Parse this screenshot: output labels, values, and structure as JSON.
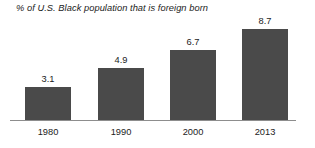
{
  "chart_data": {
    "type": "bar",
    "title": "% of U.S. Black population that is foreign born",
    "xlabel": "",
    "ylabel": "",
    "categories": [
      "1980",
      "1990",
      "2000",
      "2013"
    ],
    "values": [
      3.1,
      4.9,
      6.7,
      8.7
    ],
    "value_labels": [
      "3.1",
      "4.9",
      "6.7",
      "8.7"
    ],
    "ylim": [
      0,
      9.7
    ],
    "grid": false,
    "legend": false,
    "bar_color": "#4a4a4a",
    "axis_color": "#8d8d8d",
    "text_color": "#1c1c1c",
    "background": "#ffffff"
  }
}
